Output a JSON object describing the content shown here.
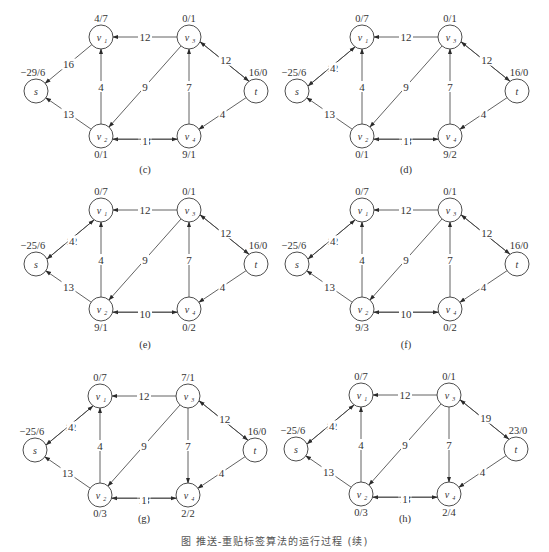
{
  "figure_caption": "图 推送-重贴标签算法的运行过程 (续)",
  "layout": {
    "node_radius": 12,
    "base_positions": {
      "s": [
        36,
        91
      ],
      "v1": [
        101,
        37
      ],
      "v2": [
        101,
        136
      ],
      "v3": [
        189,
        37
      ],
      "v4": [
        189,
        136
      ],
      "t": [
        256,
        91
      ]
    },
    "node_names": {
      "s": [
        "s",
        ""
      ],
      "v1": [
        "v",
        "1"
      ],
      "v2": [
        "v",
        "2"
      ],
      "v3": [
        "v",
        "3"
      ],
      "v4": [
        "v",
        "4"
      ],
      "t": [
        "t",
        ""
      ]
    },
    "height_label_pos": {
      "s": "above",
      "v1": "above",
      "v3": "above",
      "t": "above",
      "v2": "below",
      "v4": "below"
    }
  },
  "panels": [
    {
      "id": "c",
      "caption": "(c)",
      "offset": [
        0,
        0
      ],
      "caption_y": 173,
      "heights": {
        "s": "−29/6",
        "v1": "4/7",
        "v2": "0/1",
        "v3": "0/1",
        "v4": "9/1",
        "t": "16/0"
      },
      "edges": [
        {
          "from": "v1",
          "to": "s",
          "label": "16"
        },
        {
          "from": "v3",
          "to": "v1",
          "label": "12"
        },
        {
          "from": "v2",
          "to": "v1",
          "label": "4"
        },
        {
          "from": "v2",
          "to": "s",
          "label": "13"
        },
        {
          "from": "v3",
          "to": "v2",
          "label": "9"
        },
        {
          "from": "v4",
          "to": "v3",
          "label": "7"
        },
        {
          "from": "v3",
          "to": "t",
          "label": "8",
          "pair": -1
        },
        {
          "from": "t",
          "to": "v3",
          "label": "12",
          "pair": 1
        },
        {
          "from": "t",
          "to": "v4",
          "label": "4"
        },
        {
          "from": "v4",
          "to": "v2",
          "label": "13",
          "pair": -1
        },
        {
          "from": "v2",
          "to": "v4",
          "label": "1",
          "pair": 1
        }
      ]
    },
    {
      "id": "d",
      "caption": "(d)",
      "offset": [
        261,
        0
      ],
      "caption_y": 173,
      "heights": {
        "s": "−25/6",
        "v1": "0/7",
        "v2": "0/1",
        "v3": "0/1",
        "v4": "9/2",
        "t": "16/0"
      },
      "edges": [
        {
          "from": "v1",
          "to": "s",
          "label": "12",
          "pair": -1
        },
        {
          "from": "s",
          "to": "v1",
          "label": "4",
          "pair": 1
        },
        {
          "from": "v3",
          "to": "v1",
          "label": "12"
        },
        {
          "from": "v2",
          "to": "v1",
          "label": "4"
        },
        {
          "from": "v2",
          "to": "s",
          "label": "13"
        },
        {
          "from": "v3",
          "to": "v2",
          "label": "9"
        },
        {
          "from": "v4",
          "to": "v3",
          "label": "7"
        },
        {
          "from": "v3",
          "to": "t",
          "label": "8",
          "pair": -1
        },
        {
          "from": "t",
          "to": "v3",
          "label": "12",
          "pair": 1
        },
        {
          "from": "t",
          "to": "v4",
          "label": "4"
        },
        {
          "from": "v4",
          "to": "v2",
          "label": "13",
          "pair": -1
        },
        {
          "from": "v2",
          "to": "v4",
          "label": "1",
          "pair": 1
        }
      ]
    },
    {
      "id": "e",
      "caption": "(e)",
      "offset": [
        0,
        173
      ],
      "caption_y": 348,
      "heights": {
        "s": "−25/6",
        "v1": "0/7",
        "v2": "9/1",
        "v3": "0/1",
        "v4": "0/2",
        "t": "16/0"
      },
      "edges": [
        {
          "from": "v1",
          "to": "s",
          "label": "12",
          "pair": -1
        },
        {
          "from": "s",
          "to": "v1",
          "label": "4",
          "pair": 1
        },
        {
          "from": "v3",
          "to": "v1",
          "label": "12"
        },
        {
          "from": "v2",
          "to": "v1",
          "label": "4"
        },
        {
          "from": "v2",
          "to": "s",
          "label": "13"
        },
        {
          "from": "v3",
          "to": "v2",
          "label": "9"
        },
        {
          "from": "v4",
          "to": "v3",
          "label": "7"
        },
        {
          "from": "v3",
          "to": "t",
          "label": "8",
          "pair": -1
        },
        {
          "from": "t",
          "to": "v3",
          "label": "12",
          "pair": 1
        },
        {
          "from": "t",
          "to": "v4",
          "label": "4"
        },
        {
          "from": "v4",
          "to": "v2",
          "label": "4",
          "pair": -1
        },
        {
          "from": "v2",
          "to": "v4",
          "label": "10",
          "pair": 1
        }
      ]
    },
    {
      "id": "f",
      "caption": "(f)",
      "offset": [
        261,
        173
      ],
      "caption_y": 348,
      "heights": {
        "s": "−25/6",
        "v1": "0/7",
        "v2": "9/3",
        "v3": "0/1",
        "v4": "0/2",
        "t": "16/0"
      },
      "edges": [
        {
          "from": "v1",
          "to": "s",
          "label": "12",
          "pair": -1
        },
        {
          "from": "s",
          "to": "v1",
          "label": "4",
          "pair": 1
        },
        {
          "from": "v3",
          "to": "v1",
          "label": "12"
        },
        {
          "from": "v2",
          "to": "v1",
          "label": "4"
        },
        {
          "from": "v2",
          "to": "s",
          "label": "13"
        },
        {
          "from": "v3",
          "to": "v2",
          "label": "9"
        },
        {
          "from": "v4",
          "to": "v3",
          "label": "7"
        },
        {
          "from": "v3",
          "to": "t",
          "label": "8",
          "pair": -1
        },
        {
          "from": "t",
          "to": "v3",
          "label": "12",
          "pair": 1
        },
        {
          "from": "t",
          "to": "v4",
          "label": "4"
        },
        {
          "from": "v4",
          "to": "v2",
          "label": "4",
          "pair": -1
        },
        {
          "from": "v2",
          "to": "v4",
          "label": "10",
          "pair": 1
        }
      ]
    },
    {
      "id": "g",
      "caption": "(g)",
      "offset": [
        -1,
        359
      ],
      "caption_y": 522,
      "heights": {
        "s": "−25/6",
        "v1": "0/7",
        "v2": "0/3",
        "v3": "7/1",
        "v4": "2/2",
        "t": "16/0"
      },
      "edges": [
        {
          "from": "v1",
          "to": "s",
          "label": "12",
          "pair": -1
        },
        {
          "from": "s",
          "to": "v1",
          "label": "4",
          "pair": 1
        },
        {
          "from": "v3",
          "to": "v1",
          "label": "12"
        },
        {
          "from": "v2",
          "to": "v1",
          "label": "4"
        },
        {
          "from": "v2",
          "to": "s",
          "label": "13"
        },
        {
          "from": "v3",
          "to": "v2",
          "label": "9"
        },
        {
          "from": "v3",
          "to": "v4",
          "label": "7"
        },
        {
          "from": "v3",
          "to": "t",
          "label": "8",
          "pair": -1
        },
        {
          "from": "t",
          "to": "v3",
          "label": "12",
          "pair": 1
        },
        {
          "from": "t",
          "to": "v4",
          "label": "4"
        },
        {
          "from": "v4",
          "to": "v2",
          "label": "13",
          "pair": -1
        },
        {
          "from": "v2",
          "to": "v4",
          "label": "1",
          "pair": 1
        }
      ]
    },
    {
      "id": "h",
      "caption": "(h)",
      "offset": [
        260,
        358
      ],
      "caption_y": 522,
      "heights": {
        "s": "−25/6",
        "v1": "0/7",
        "v2": "0/3",
        "v3": "0/1",
        "v4": "2/4",
        "t": "23/0"
      },
      "edges": [
        {
          "from": "v1",
          "to": "s",
          "label": "12",
          "pair": -1
        },
        {
          "from": "s",
          "to": "v1",
          "label": "4",
          "pair": 1
        },
        {
          "from": "v3",
          "to": "v1",
          "label": "12"
        },
        {
          "from": "v2",
          "to": "v1",
          "label": "4"
        },
        {
          "from": "v2",
          "to": "s",
          "label": "13"
        },
        {
          "from": "v3",
          "to": "v2",
          "label": "9"
        },
        {
          "from": "v3",
          "to": "v4",
          "label": "7"
        },
        {
          "from": "v3",
          "to": "t",
          "label": "1",
          "pair": -1
        },
        {
          "from": "t",
          "to": "v3",
          "label": "19",
          "pair": 1
        },
        {
          "from": "t",
          "to": "v4",
          "label": "4"
        },
        {
          "from": "v4",
          "to": "v2",
          "label": "13",
          "pair": -1
        },
        {
          "from": "v2",
          "to": "v4",
          "label": "1",
          "pair": 1
        }
      ]
    }
  ]
}
